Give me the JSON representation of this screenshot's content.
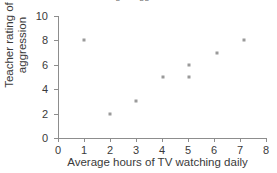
{
  "chart_data": {
    "type": "scatter",
    "title": "rating of aggression",
    "xlabel": "Average hours of TV watching daily",
    "ylabel_line1": "Teacher rating of",
    "ylabel_line2": "aggression",
    "xlim": [
      0,
      8
    ],
    "ylim": [
      0,
      10
    ],
    "xticks": [
      0,
      1,
      2,
      3,
      4,
      5,
      6,
      7,
      8
    ],
    "yticks": [
      0,
      2,
      4,
      6,
      8,
      10
    ],
    "grid": false,
    "legend": "none",
    "marker_color": "#9a9a9a",
    "axis_color": "#8d8d8d",
    "points": [
      {
        "x": 1.0,
        "y": 8
      },
      {
        "x": 2.0,
        "y": 2
      },
      {
        "x": 3.0,
        "y": 3
      },
      {
        "x": 4.05,
        "y": 5
      },
      {
        "x": 5.05,
        "y": 6
      },
      {
        "x": 5.05,
        "y": 5
      },
      {
        "x": 6.1,
        "y": 7
      },
      {
        "x": 7.15,
        "y": 8
      }
    ]
  }
}
